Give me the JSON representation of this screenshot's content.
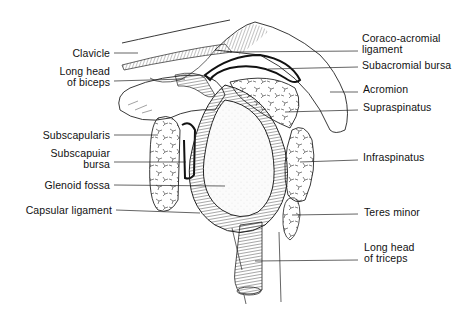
{
  "figure": {
    "labels_left": [
      {
        "id": "clavicle",
        "text": "Clavicle",
        "x": 0,
        "y": 48,
        "w": 110
      },
      {
        "id": "long-head-biceps",
        "text": "Long head\nof biceps",
        "x": 0,
        "y": 66,
        "w": 110
      },
      {
        "id": "subscapularis",
        "text": "Subscapularis",
        "x": 0,
        "y": 130,
        "w": 110
      },
      {
        "id": "subscapular-bursa",
        "text": "Subscapuiar\nbursa",
        "x": 0,
        "y": 148,
        "w": 110
      },
      {
        "id": "glenoid-fossa",
        "text": "Glenoid fossa",
        "x": 0,
        "y": 180,
        "w": 110
      },
      {
        "id": "capsular-ligament",
        "text": "Capsular ligament",
        "x": 0,
        "y": 205,
        "w": 112
      }
    ],
    "labels_right": [
      {
        "id": "coraco-acromial-ligament",
        "text": "Coraco-acromial\nligament",
        "x": 362,
        "y": 33
      },
      {
        "id": "subacromial-bursa",
        "text": "Subacromial bursa",
        "x": 362,
        "y": 60
      },
      {
        "id": "acromion",
        "text": "Acromion",
        "x": 363,
        "y": 84
      },
      {
        "id": "supraspinatus",
        "text": "Supraspinatus",
        "x": 363,
        "y": 102
      },
      {
        "id": "infraspinatus",
        "text": "Infraspinatus",
        "x": 363,
        "y": 152
      },
      {
        "id": "teres-minor",
        "text": "Teres minor",
        "x": 364,
        "y": 207
      },
      {
        "id": "long-head-triceps",
        "text": "Long head\nof triceps",
        "x": 364,
        "y": 242
      }
    ]
  }
}
